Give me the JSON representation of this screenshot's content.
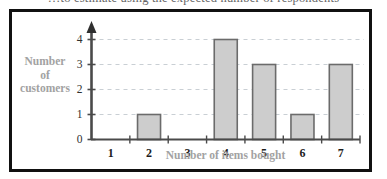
{
  "page": {
    "cropped_header_text": "…to estimate using the expected number of respondents"
  },
  "chart_data": {
    "type": "bar",
    "title": "",
    "xlabel": "Number of items bought",
    "ylabel": "Number of customers",
    "ylabel_lines": [
      "Number",
      "of",
      "customers"
    ],
    "categories": [
      "1",
      "2",
      "3",
      "4",
      "5",
      "6",
      "7"
    ],
    "values": [
      0,
      1,
      0,
      4,
      3,
      1,
      3
    ],
    "y_ticks": [
      "0",
      "1",
      "2",
      "3",
      "4"
    ],
    "ylim": [
      0,
      4
    ],
    "grid": true,
    "grid_axis": "y",
    "legend": "none",
    "colors": {
      "bar_fill": "#cdcdcd",
      "bar_edge": "#6b6b6b",
      "axis": "#4a4a4a",
      "grid": "#c9cfd4",
      "label_text": "#a2a2a2",
      "tick_text": "#1d1d1d",
      "frame": "#111111",
      "background": "#ffffff"
    }
  }
}
